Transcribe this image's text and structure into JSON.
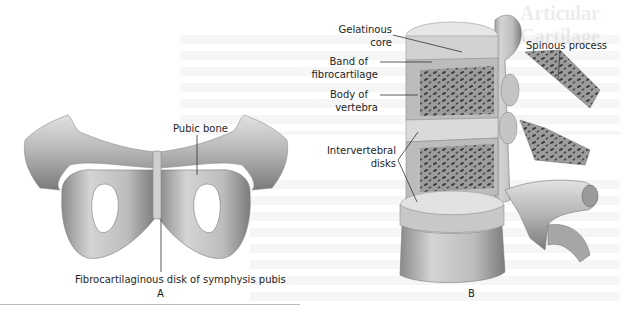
{
  "figure": {
    "panel_a": {
      "letter": "A",
      "labels": {
        "pubic_bone": "Pubic bone",
        "symphysis_disk": "Fibrocartilaginous disk of symphysis pubis"
      }
    },
    "panel_b": {
      "letter": "B",
      "labels": {
        "gelatinous_core_1": "Gelatinous",
        "gelatinous_core_2": "core",
        "band_1": "Band of",
        "band_2": "fibrocartilage",
        "body_1": "Body of",
        "body_2": "vertebra",
        "disks_1": "Intervertebral",
        "disks_2": "disks",
        "spinous_process": "Spinous process"
      }
    },
    "show_through_heading": "Articular Cartilage"
  },
  "colors": {
    "bone_light": "#d9d9d9",
    "bone_mid": "#a8a8a8",
    "bone_dark": "#6e6e6e",
    "leader_line": "#333333"
  }
}
